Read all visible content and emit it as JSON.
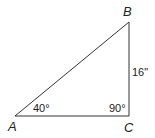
{
  "diagram": {
    "type": "right-triangle",
    "vertices": [
      {
        "name": "A",
        "label": "A",
        "x": 15,
        "y": 116
      },
      {
        "name": "B",
        "label": "B",
        "x": 129,
        "y": 22
      },
      {
        "name": "C",
        "label": "C",
        "x": 129,
        "y": 116
      }
    ],
    "angles": {
      "A": "40°",
      "C": "90°"
    },
    "sides": {
      "BC": "16\""
    },
    "colors": {
      "line": "#333333",
      "text": "#222222",
      "background": "#ffffff"
    }
  }
}
